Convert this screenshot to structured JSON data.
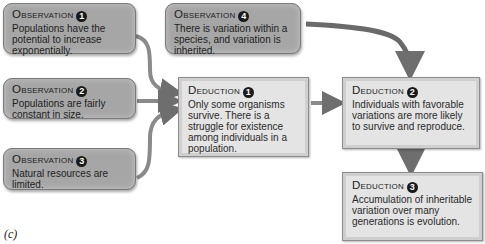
{
  "observations": [
    {
      "label": "Observation",
      "number": "1",
      "text": "Populations have the potential to increase exponentially."
    },
    {
      "label": "Observation",
      "number": "2",
      "text": "Populations are fairly constant in size."
    },
    {
      "label": "Observation",
      "number": "3",
      "text": "Natural resources are limited."
    },
    {
      "label": "Observation",
      "number": "4",
      "text": "There is variation within a species, and variation is inherited."
    }
  ],
  "deductions": [
    {
      "label": "Deduction",
      "number": "1",
      "text": "Only some organisms survive. There is a struggle for existence among individuals in a population."
    },
    {
      "label": "Deduction",
      "number": "2",
      "text": "Individuals with favorable variations are more likely to survive and reproduce."
    },
    {
      "label": "Deduction",
      "number": "3",
      "text": "Accumulation of inheritable variation over many generations is evolution."
    }
  ],
  "caption": "(c)",
  "colors": {
    "observation_fill": "#a6a6a6",
    "deduction_fill": "#e4e4e4",
    "arrow": "#7d7d7d"
  }
}
